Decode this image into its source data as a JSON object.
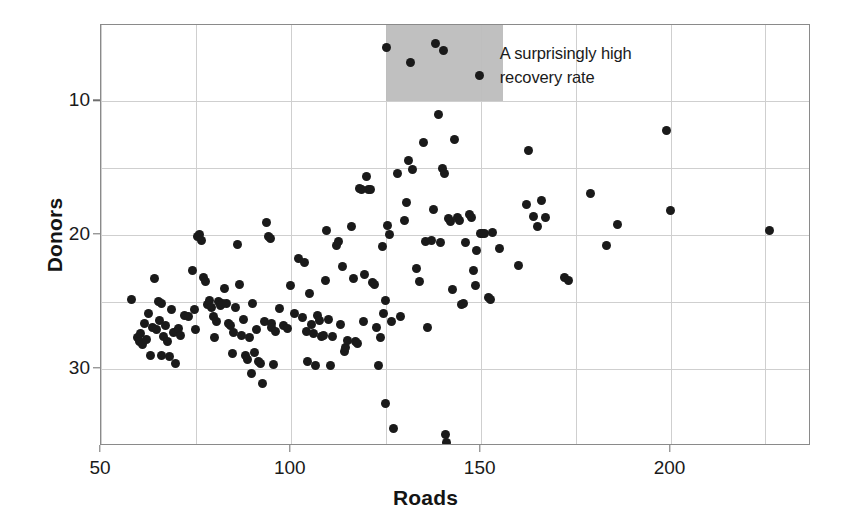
{
  "chart_data": {
    "type": "scatter",
    "title": "",
    "xlabel": "Roads",
    "ylabel": "Donors",
    "xlim": [
      50,
      237
    ],
    "ylim": [
      4.2,
      35.7
    ],
    "xticks": [
      50,
      100,
      150,
      200
    ],
    "yticks": [
      10,
      20,
      30
    ],
    "gridlines_y": [
      10,
      15,
      20,
      25,
      30
    ],
    "gridlines_x": [
      50,
      75,
      100,
      125,
      150,
      175,
      200,
      225
    ],
    "grid": true,
    "legend": "none",
    "point_color": "#1a1a1a",
    "point_size_px": 9,
    "annotations": [
      {
        "text": "A surprisingly high\nrecovery rate",
        "x": 155,
        "y": 33.4,
        "highlight_rect": {
          "x0": 125,
          "x1": 156,
          "y0": 30.0,
          "y1": 35.7,
          "color": "#bdbdbd"
        }
      }
    ],
    "points": [
      [
        58.0,
        15.2
      ],
      [
        59.5,
        12.3
      ],
      [
        60.0,
        12.0
      ],
      [
        60.5,
        12.6
      ],
      [
        61.0,
        11.8
      ],
      [
        61.5,
        13.4
      ],
      [
        62.0,
        12.2
      ],
      [
        62.5,
        14.1
      ],
      [
        63.0,
        11.0
      ],
      [
        63.5,
        13.1
      ],
      [
        64.0,
        16.7
      ],
      [
        64.5,
        12.9
      ],
      [
        65.0,
        15.0
      ],
      [
        65.5,
        13.6
      ],
      [
        65.8,
        14.9
      ],
      [
        66.0,
        11.0
      ],
      [
        66.5,
        12.4
      ],
      [
        67.0,
        13.2
      ],
      [
        67.5,
        12.0
      ],
      [
        68.0,
        10.9
      ],
      [
        68.5,
        14.4
      ],
      [
        69.0,
        12.7
      ],
      [
        69.5,
        10.4
      ],
      [
        70.0,
        12.8
      ],
      [
        70.5,
        13.0
      ],
      [
        71.0,
        12.5
      ],
      [
        72.0,
        14.0
      ],
      [
        73.0,
        13.9
      ],
      [
        74.0,
        17.3
      ],
      [
        74.5,
        14.4
      ],
      [
        75.0,
        12.9
      ],
      [
        75.5,
        19.9
      ],
      [
        76.0,
        20.0
      ],
      [
        76.5,
        19.6
      ],
      [
        77.0,
        16.8
      ],
      [
        77.5,
        16.5
      ],
      [
        78.0,
        14.8
      ],
      [
        78.5,
        15.1
      ],
      [
        79.0,
        14.6
      ],
      [
        79.5,
        13.9
      ],
      [
        80.0,
        12.3
      ],
      [
        80.5,
        13.5
      ],
      [
        81.0,
        15.0
      ],
      [
        81.5,
        14.7
      ],
      [
        82.0,
        14.9
      ],
      [
        82.5,
        16.0
      ],
      [
        83.0,
        14.9
      ],
      [
        83.5,
        13.4
      ],
      [
        84.0,
        13.2
      ],
      [
        84.5,
        11.1
      ],
      [
        85.0,
        12.7
      ],
      [
        85.5,
        14.6
      ],
      [
        86.0,
        19.3
      ],
      [
        86.5,
        16.3
      ],
      [
        87.0,
        12.5
      ],
      [
        87.5,
        13.7
      ],
      [
        88.0,
        11.0
      ],
      [
        88.5,
        10.7
      ],
      [
        89.0,
        12.3
      ],
      [
        89.5,
        9.6
      ],
      [
        90.0,
        14.9
      ],
      [
        90.5,
        11.2
      ],
      [
        91.0,
        12.9
      ],
      [
        91.5,
        10.5
      ],
      [
        92.0,
        10.4
      ],
      [
        92.5,
        8.9
      ],
      [
        93.0,
        13.5
      ],
      [
        93.5,
        20.9
      ],
      [
        94.0,
        19.9
      ],
      [
        94.5,
        19.7
      ],
      [
        94.8,
        13.4
      ],
      [
        95.0,
        13.1
      ],
      [
        95.5,
        10.3
      ],
      [
        96.0,
        12.8
      ],
      [
        97.0,
        14.5
      ],
      [
        98.0,
        13.2
      ],
      [
        99.0,
        13.0
      ],
      [
        100.0,
        16.2
      ],
      [
        101.0,
        14.1
      ],
      [
        102.0,
        18.2
      ],
      [
        103.0,
        13.8
      ],
      [
        103.5,
        17.9
      ],
      [
        104.0,
        12.8
      ],
      [
        104.5,
        10.5
      ],
      [
        105.0,
        15.6
      ],
      [
        105.5,
        13.3
      ],
      [
        106.0,
        12.6
      ],
      [
        106.5,
        10.2
      ],
      [
        107.0,
        14.0
      ],
      [
        107.5,
        13.6
      ],
      [
        108.0,
        12.4
      ],
      [
        108.5,
        12.5
      ],
      [
        109.0,
        16.6
      ],
      [
        109.5,
        20.3
      ],
      [
        110.0,
        13.7
      ],
      [
        110.5,
        10.2
      ],
      [
        111.0,
        12.4
      ],
      [
        112.0,
        19.2
      ],
      [
        112.5,
        19.5
      ],
      [
        113.0,
        13.3
      ],
      [
        113.5,
        17.6
      ],
      [
        114.0,
        11.3
      ],
      [
        114.5,
        11.6
      ],
      [
        115.0,
        12.1
      ],
      [
        116.0,
        20.6
      ],
      [
        116.5,
        16.7
      ],
      [
        117.0,
        12.0
      ],
      [
        117.5,
        11.9
      ],
      [
        118.0,
        23.5
      ],
      [
        118.5,
        23.4
      ],
      [
        119.0,
        13.5
      ],
      [
        119.5,
        17.0
      ],
      [
        120.0,
        24.4
      ],
      [
        120.5,
        23.4
      ],
      [
        121.0,
        23.4
      ],
      [
        121.5,
        16.4
      ],
      [
        122.0,
        16.3
      ],
      [
        122.5,
        13.1
      ],
      [
        123.0,
        10.2
      ],
      [
        123.5,
        12.3
      ],
      [
        124.0,
        19.1
      ],
      [
        124.5,
        14.1
      ],
      [
        124.8,
        7.4
      ],
      [
        125.0,
        15.1
      ],
      [
        125.2,
        34.0
      ],
      [
        125.5,
        20.7
      ],
      [
        126.0,
        20.0
      ],
      [
        126.5,
        13.5
      ],
      [
        127.0,
        5.5
      ],
      [
        128.0,
        24.6
      ],
      [
        129.0,
        13.9
      ],
      [
        130.0,
        21.1
      ],
      [
        130.5,
        22.4
      ],
      [
        131.0,
        25.6
      ],
      [
        131.5,
        32.9
      ],
      [
        132.0,
        24.9
      ],
      [
        133.0,
        17.5
      ],
      [
        134.0,
        16.5
      ],
      [
        135.0,
        26.9
      ],
      [
        135.5,
        19.5
      ],
      [
        136.0,
        13.1
      ],
      [
        137.0,
        19.6
      ],
      [
        137.5,
        21.9
      ],
      [
        138.0,
        34.3
      ],
      [
        139.0,
        29.0
      ],
      [
        139.5,
        19.4
      ],
      [
        140.0,
        25.0
      ],
      [
        140.3,
        33.8
      ],
      [
        140.5,
        24.6
      ],
      [
        140.8,
        5.1
      ],
      [
        141.0,
        4.5
      ],
      [
        141.5,
        21.2
      ],
      [
        142.0,
        21.0
      ],
      [
        142.5,
        15.9
      ],
      [
        143.0,
        27.1
      ],
      [
        144.0,
        21.3
      ],
      [
        144.5,
        21.1
      ],
      [
        145.0,
        14.8
      ],
      [
        145.5,
        14.9
      ],
      [
        146.0,
        19.4
      ],
      [
        147.0,
        21.5
      ],
      [
        147.5,
        21.3
      ],
      [
        148.0,
        17.3
      ],
      [
        148.5,
        16.2
      ],
      [
        149.0,
        18.8
      ],
      [
        149.8,
        31.9
      ],
      [
        150.0,
        20.1
      ],
      [
        150.5,
        20.1
      ],
      [
        151.0,
        20.1
      ],
      [
        152.0,
        15.3
      ],
      [
        152.5,
        15.2
      ],
      [
        153.0,
        20.2
      ],
      [
        155.0,
        19.0
      ],
      [
        160.0,
        17.7
      ],
      [
        162.0,
        22.3
      ],
      [
        162.5,
        26.3
      ],
      [
        164.0,
        21.4
      ],
      [
        165.0,
        20.6
      ],
      [
        166.0,
        22.6
      ],
      [
        167.0,
        21.3
      ],
      [
        172.0,
        16.8
      ],
      [
        173.0,
        16.6
      ],
      [
        179.0,
        23.1
      ],
      [
        183.0,
        19.2
      ],
      [
        186.0,
        20.8
      ],
      [
        199.0,
        27.8
      ],
      [
        200.0,
        21.8
      ],
      [
        226.0,
        20.3
      ]
    ],
    "highlighted_points": [
      [
        125.2,
        34.0
      ],
      [
        131.5,
        32.9
      ],
      [
        138.0,
        34.3
      ],
      [
        140.3,
        33.8
      ],
      [
        149.8,
        31.9
      ]
    ]
  },
  "axes": {
    "y_title": "Donors",
    "x_title": "Roads",
    "y_tick_labels": [
      "30",
      "20",
      "10"
    ],
    "x_tick_labels": [
      "50",
      "100",
      "150",
      "200"
    ]
  },
  "colors": {
    "point": "#1a1a1a",
    "highlight": "#bdbdbd",
    "gridline": "#cfcfcf",
    "frame": "#8a8a8a",
    "text": "#1a1a1a",
    "background": "#ffffff"
  }
}
